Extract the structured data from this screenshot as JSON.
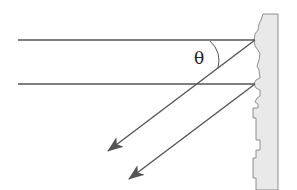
{
  "diagram": {
    "type": "ray-reflection",
    "angle_label": "θ",
    "colors": {
      "ray": "#555555",
      "arrowhead": "#555555",
      "wall_fill": "#e9e9e9",
      "wall_edge": "#777777",
      "text": "#222222"
    },
    "incoming_rays": [
      {
        "from": [
          18,
          40
        ],
        "to": [
          255,
          40
        ]
      },
      {
        "from": [
          18,
          84
        ],
        "to": [
          255,
          84
        ]
      }
    ],
    "reflected_rays": [
      {
        "from": [
          255,
          40
        ],
        "to": [
          107,
          152
        ]
      },
      {
        "from": [
          255,
          84
        ],
        "to": [
          128,
          180
        ]
      }
    ],
    "wall": {
      "x": 253,
      "width": 25,
      "y_top": 14,
      "y_bottom": 190
    }
  }
}
